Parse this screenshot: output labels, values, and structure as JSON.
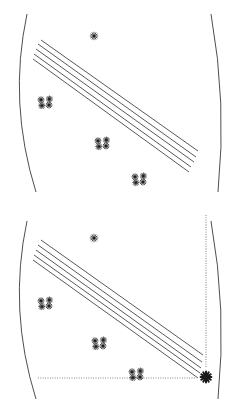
{
  "figure": {
    "width": 245,
    "height": 413,
    "background_color": "#ffffff",
    "stroke_color": "#3a3a3a",
    "dotted_color": "#9a9a9a",
    "marker_color": "#1a1a1a"
  },
  "panels": [
    {
      "id": "panel-top",
      "name": "top-panel",
      "label": "",
      "boundary": {
        "type": "vesica",
        "left_arc_label": "left-boundary-arc",
        "right_arc_label": "right-boundary-arc",
        "left_arc_top": [
          27,
          14
        ],
        "left_arc_bottom": [
          36,
          192
        ],
        "left_arc_bulge_x": 8,
        "right_arc_top": [
          211,
          14
        ],
        "right_arc_bottom": [
          218,
          192
        ],
        "right_arc_bulge_x": 227
      },
      "line_bundle": {
        "name": "diagonal-line-bundle",
        "count": 5,
        "angle_deg": 34,
        "lines": [
          {
            "x1": 41,
            "y1": 40,
            "x2": 198,
            "y2": 151
          },
          {
            "x1": 38,
            "y1": 44,
            "x2": 196,
            "y2": 157
          },
          {
            "x1": 36,
            "y1": 49,
            "x2": 194,
            "y2": 162
          },
          {
            "x1": 34,
            "y1": 54,
            "x2": 191,
            "y2": 167
          },
          {
            "x1": 33,
            "y1": 59,
            "x2": 189,
            "y2": 172
          }
        ]
      },
      "markers": [
        {
          "name": "star-single-top",
          "type": "star-small",
          "x": 94,
          "y": 36,
          "count": 1
        },
        {
          "name": "star-cluster-left",
          "type": "star-cluster",
          "x": 46,
          "y": 103,
          "count": 4
        },
        {
          "name": "star-cluster-mid",
          "type": "star-cluster",
          "x": 103,
          "y": 144,
          "count": 4
        },
        {
          "name": "star-cluster-lower",
          "type": "star-cluster",
          "x": 140,
          "y": 180,
          "count": 4
        }
      ],
      "dotted_guides": []
    },
    {
      "id": "panel-bottom",
      "name": "bottom-panel",
      "label": "",
      "boundary": {
        "type": "vesica",
        "left_arc_label": "left-boundary-arc",
        "right_arc_label": "right-boundary-arc",
        "left_arc_top": [
          27,
          14
        ],
        "left_arc_bottom": [
          36,
          192
        ],
        "left_arc_bulge_x": 8,
        "right_arc_top": [
          211,
          14
        ],
        "right_arc_bottom": [
          218,
          192
        ],
        "right_arc_bulge_x": 227
      },
      "line_bundle": {
        "name": "diagonal-line-bundle",
        "count": 5,
        "angle_deg": 34,
        "lines": [
          {
            "x1": 41,
            "y1": 33,
            "x2": 203,
            "y2": 148
          },
          {
            "x1": 38,
            "y1": 38,
            "x2": 202,
            "y2": 155
          },
          {
            "x1": 36,
            "y1": 43,
            "x2": 201,
            "y2": 161
          },
          {
            "x1": 34,
            "y1": 48,
            "x2": 200,
            "y2": 166
          },
          {
            "x1": 33,
            "y1": 53,
            "x2": 198,
            "y2": 171
          }
        ]
      },
      "markers": [
        {
          "name": "star-single-top",
          "type": "star-small",
          "x": 94,
          "y": 31,
          "count": 1
        },
        {
          "name": "star-cluster-left",
          "type": "star-cluster",
          "x": 46,
          "y": 97,
          "count": 4
        },
        {
          "name": "star-cluster-mid",
          "type": "star-cluster",
          "x": 100,
          "y": 137,
          "count": 4
        },
        {
          "name": "star-cluster-lower",
          "type": "star-cluster",
          "x": 137,
          "y": 168,
          "count": 4
        },
        {
          "name": "asterisk-origin-marker",
          "type": "asterisk-bold",
          "x": 206,
          "y": 170,
          "count": 1
        }
      ],
      "dotted_guides": [
        {
          "name": "vertical-dotted-axis",
          "orientation": "vertical",
          "x": 206,
          "y1": 8,
          "y2": 160
        },
        {
          "name": "horizontal-dotted-axis",
          "orientation": "horizontal",
          "y": 171,
          "x1": 38,
          "x2": 196
        }
      ]
    }
  ]
}
